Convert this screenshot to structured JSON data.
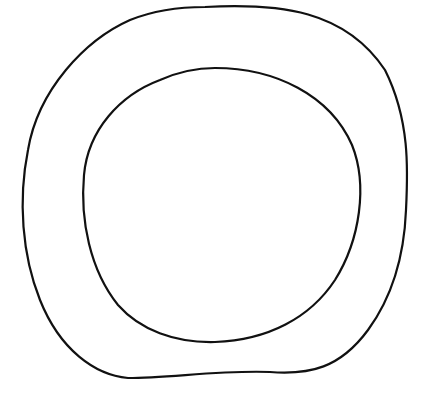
{
  "drawing": {
    "subject": "hand-drawn ring",
    "background": "#ffffff",
    "stroke_color": "#111111",
    "shapes": [
      {
        "name": "outer-ring-outline",
        "path": "M 205 7 C 280 3, 345 10, 385 70 C 410 120, 408 170, 406 210 C 404 260, 390 300, 368 330 C 340 368, 310 375, 270 372 C 220 370, 170 378, 128 378 C 95 375, 60 350, 40 300 C 22 255, 18 200, 28 150 C 38 90, 85 40, 130 20 C 155 10, 180 7, 205 7 Z"
      },
      {
        "name": "inner-ring-outline",
        "path": "M 215 68 C 275 68, 330 95, 352 145 C 368 185, 360 240, 335 280 C 310 318, 268 340, 215 342 C 175 343, 140 330, 118 305 C 90 270, 80 220, 84 175 C 88 130, 120 95, 160 80 C 178 72, 196 68, 215 68 Z"
      }
    ]
  }
}
